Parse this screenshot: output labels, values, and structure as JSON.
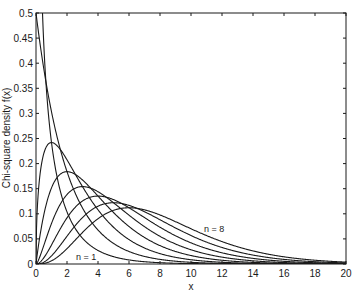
{
  "chart_data": {
    "type": "line",
    "title": "",
    "xlabel": "x",
    "ylabel": "Chi-square density f(x)",
    "xlim": [
      0,
      20
    ],
    "ylim": [
      0,
      0.5
    ],
    "grid": false,
    "legend": null,
    "x_ticks": [
      "0",
      "2",
      "4",
      "6",
      "8",
      "10",
      "12",
      "14",
      "16",
      "18",
      "20"
    ],
    "y_ticks": [
      "0",
      "0.05",
      "0.1",
      "0.15",
      "0.2",
      "0.25",
      "0.3",
      "0.35",
      "0.4",
      "0.45",
      "0.5"
    ],
    "annotations": [
      {
        "text": "n = 1",
        "x": 4.0,
        "y": 0.015
      },
      {
        "text": "n = 8",
        "x": 10.8,
        "y": 0.07
      }
    ],
    "x": [
      0,
      1,
      2,
      4,
      6,
      8,
      10,
      15,
      20
    ],
    "series": [
      {
        "name": "n = 1",
        "dof": 1,
        "values": [
          0.5,
          0.242,
          0.104,
          0.027,
          0.008,
          0.0025,
          0.0009,
          0.0,
          0.0
        ]
      },
      {
        "name": "n = 2",
        "dof": 2,
        "values": [
          0.5,
          0.303,
          0.184,
          0.068,
          0.025,
          0.0092,
          0.0034,
          0.0003,
          0.0
        ]
      },
      {
        "name": "n = 3",
        "dof": 3,
        "values": [
          0.0,
          0.242,
          0.208,
          0.108,
          0.048,
          0.02,
          0.0085,
          0.0011,
          0.0001
        ]
      },
      {
        "name": "n = 4",
        "dof": 4,
        "values": [
          0.0,
          0.152,
          0.184,
          0.135,
          0.075,
          0.037,
          0.017,
          0.0021,
          0.0005
        ]
      },
      {
        "name": "n = 5",
        "dof": 5,
        "values": [
          0.0,
          0.081,
          0.138,
          0.144,
          0.097,
          0.053,
          0.027,
          0.0054,
          0.001
        ]
      },
      {
        "name": "n = 6",
        "dof": 6,
        "values": [
          0.0,
          0.038,
          0.092,
          0.135,
          0.112,
          0.073,
          0.042,
          0.0099,
          0.0019
        ]
      },
      {
        "name": "n = 7",
        "dof": 7,
        "values": [
          0.0,
          0.016,
          0.055,
          0.115,
          0.119,
          0.087,
          0.056,
          0.0163,
          0.0037
        ]
      },
      {
        "name": "n = 8",
        "dof": 8,
        "values": [
          0.0,
          0.006,
          0.031,
          0.09,
          0.112,
          0.098,
          0.067,
          0.0247,
          0.0068
        ]
      }
    ],
    "colors": {
      "line": "#1a1a1a",
      "axes": "#1a1a1a",
      "background": "#ffffff"
    }
  }
}
